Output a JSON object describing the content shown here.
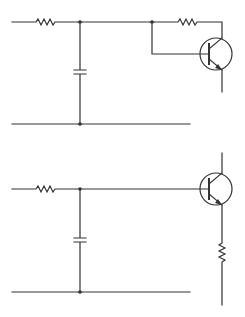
{
  "diagram": {
    "type": "circuit-schematic",
    "background": "#ffffff",
    "stroke_color": "#333333",
    "circuits": [
      {
        "name": "top-circuit",
        "description": "RC low-pass input feeding NPN transistor base; collector resistor tied from base node",
        "components": [
          "input-resistor",
          "shunt-capacitor",
          "npn-transistor",
          "collector-base-resistor"
        ],
        "labels": []
      },
      {
        "name": "bottom-circuit",
        "description": "RC low-pass input feeding NPN emitter follower with emitter resistor",
        "components": [
          "input-resistor",
          "shunt-capacitor",
          "npn-transistor",
          "emitter-resistor"
        ],
        "labels": []
      }
    ]
  }
}
